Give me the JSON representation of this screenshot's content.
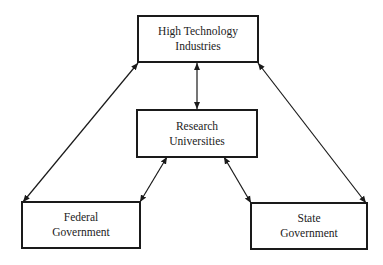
{
  "diagram": {
    "nodes": [
      {
        "id": "high-tech",
        "line1": "High Technology",
        "line2": "Industries"
      },
      {
        "id": "research",
        "line1": "Research",
        "line2": "Universities"
      },
      {
        "id": "federal",
        "line1": "Federal",
        "line2": "Government"
      },
      {
        "id": "state",
        "line1": "State",
        "line2": "Government"
      }
    ],
    "edges": [
      {
        "from": "high-tech",
        "to": "research",
        "type": "bidirectional"
      },
      {
        "from": "high-tech",
        "to": "federal",
        "type": "bidirectional"
      },
      {
        "from": "high-tech",
        "to": "state",
        "type": "bidirectional"
      },
      {
        "from": "research",
        "to": "federal",
        "type": "bidirectional"
      },
      {
        "from": "research",
        "to": "state",
        "type": "bidirectional"
      }
    ],
    "colors": {
      "line": "#1a1a1a",
      "text": "#222222",
      "background": "#ffffff"
    }
  }
}
